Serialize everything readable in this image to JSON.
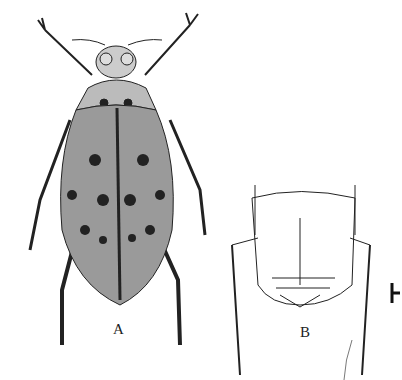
{
  "figure": {
    "panels": [
      {
        "id": "A",
        "label": "A",
        "subject": "dorsal habitus of spotted water beetle"
      },
      {
        "id": "B",
        "label": "B",
        "subject": "ventral view of abdominal apex with metacoxae"
      }
    ],
    "scale_bar": {
      "visible": true
    }
  },
  "colors": {
    "ink": "#1a1a1a",
    "body_tone": "#9a9a9a",
    "background": "#ffffff"
  }
}
